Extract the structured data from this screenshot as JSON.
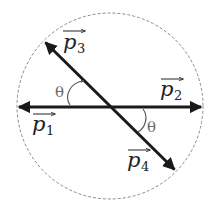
{
  "diagram": {
    "colors": {
      "background": "#ffffff",
      "circle": "#8a8a8a",
      "vectors": "#1a1a1a",
      "arc": "#555555",
      "theta": "#6a6a6a",
      "labels": "#222222"
    },
    "circle": {
      "cx": 110,
      "cy": 106,
      "r": 93,
      "style": "dashed"
    },
    "vectors": [
      {
        "id": "p1",
        "name": "p",
        "sub": "1",
        "direction": "left",
        "tip": [
          17,
          107
        ]
      },
      {
        "id": "p2",
        "name": "p",
        "sub": "2",
        "direction": "right",
        "tip": [
          203,
          107
        ]
      },
      {
        "id": "p3",
        "name": "p",
        "sub": "3",
        "direction": "up-left",
        "tip": [
          44,
          41
        ]
      },
      {
        "id": "p4",
        "name": "p",
        "sub": "4",
        "direction": "down-right",
        "tip": [
          176,
          171
        ]
      }
    ],
    "angles": [
      {
        "label": "θ",
        "position": "upper-left",
        "between": [
          "p1",
          "p3"
        ],
        "arrow": true
      },
      {
        "label": "θ",
        "position": "lower-right",
        "between": [
          "p2",
          "p4"
        ],
        "arrow": false
      }
    ]
  },
  "labels": {
    "p1": {
      "name": "p",
      "sub": "1"
    },
    "p2": {
      "name": "p",
      "sub": "2"
    },
    "p3": {
      "name": "p",
      "sub": "3"
    },
    "p4": {
      "name": "p",
      "sub": "4"
    },
    "theta_upper": "θ",
    "theta_lower": "θ"
  }
}
